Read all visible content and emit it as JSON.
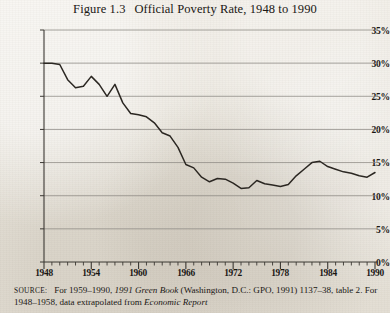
{
  "figure": {
    "number": "Figure 1.3",
    "title": "Official Poverty Rate, 1948 to 1990",
    "full_title": "Figure 1.3   Official Poverty Rate, 1948 to 1990"
  },
  "source_note": {
    "label": "SOURCE:",
    "part1": "For 1959–1990, ",
    "italic1": "1991 Green Book",
    "part2": " (Washington, D.C.: GPO, 1991)",
    "part3": "1137–38, table 2. For 1948–1958, data extrapolated from ",
    "italic2": "Economic Report",
    "line1": "SOURCE:   For 1959–1990, 1991 Green Book (Washington, D.C.: GPO, 1991)",
    "line2": "1137–38, table 2. For 1948–1958, data extrapolated from Economic Report"
  },
  "colors": {
    "paper": "#e8e4dc",
    "ink": "#1a1714",
    "line": "#2b2722",
    "grid": "#8d8a84",
    "axis": "#3b3833"
  },
  "chart_data": {
    "type": "line",
    "title": "Official Poverty Rate, 1948 to 1990",
    "xlabel": "",
    "ylabel": "",
    "xlim": [
      1948,
      1990
    ],
    "ylim": [
      0,
      35
    ],
    "grid": true,
    "legend": "none",
    "y_ticks": [
      0,
      5,
      10,
      15,
      20,
      25,
      30,
      35
    ],
    "y_tick_labels": [
      "0%",
      "5%",
      "10%",
      "15%",
      "20%",
      "25%",
      "30%",
      "35%"
    ],
    "x_ticks": [
      1948,
      1954,
      1960,
      1966,
      1972,
      1978,
      1984,
      1990
    ],
    "x_tick_labels": [
      "1948",
      "1954",
      "1960",
      "1966",
      "1972",
      "1978",
      "1984",
      "1990"
    ],
    "x_minor_tick_interval": 1,
    "x": [
      1948,
      1949,
      1950,
      1951,
      1952,
      1953,
      1954,
      1955,
      1956,
      1957,
      1958,
      1959,
      1960,
      1961,
      1962,
      1963,
      1964,
      1965,
      1966,
      1967,
      1968,
      1969,
      1970,
      1971,
      1972,
      1973,
      1974,
      1975,
      1976,
      1977,
      1978,
      1979,
      1980,
      1981,
      1982,
      1983,
      1984,
      1985,
      1986,
      1987,
      1988,
      1989,
      1990
    ],
    "series": [
      {
        "name": "Official Poverty Rate",
        "values": [
          30.0,
          30.0,
          29.8,
          27.5,
          26.3,
          26.5,
          28.0,
          26.8,
          25.0,
          26.8,
          24.0,
          22.4,
          22.2,
          21.9,
          21.0,
          19.5,
          19.0,
          17.3,
          14.7,
          14.2,
          12.8,
          12.1,
          12.6,
          12.5,
          11.9,
          11.1,
          11.2,
          12.3,
          11.8,
          11.6,
          11.4,
          11.7,
          13.0,
          14.0,
          15.0,
          15.2,
          14.4,
          14.0,
          13.6,
          13.4,
          13.0,
          12.8,
          13.5
        ]
      }
    ]
  }
}
